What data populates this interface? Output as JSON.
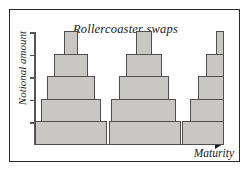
{
  "chart_data": {
    "type": "bar",
    "title": "Rollercoaster swaps",
    "xlabel": "Maturity",
    "ylabel": "Notional amount",
    "grid": false,
    "legend": null,
    "axis": {
      "y_tick_count": 5,
      "y_tick_values": [
        1,
        2,
        3,
        4,
        5
      ],
      "x_tick_labels": [],
      "ylim": [
        0,
        5.6
      ],
      "y_axis_arrow": false,
      "x_axis_arrow": true
    },
    "groups": [
      {
        "name": "period-1",
        "shape": "symmetric-pyramid",
        "steps": [
          {
            "level": 1,
            "value": 1,
            "x_start": 0.0,
            "x_end": 1.0
          },
          {
            "level": 2,
            "value": 2,
            "x_start": 0.08,
            "x_end": 0.92
          },
          {
            "level": 3,
            "value": 3,
            "x_start": 0.17,
            "x_end": 0.83
          },
          {
            "level": 4,
            "value": 4,
            "x_start": 0.26,
            "x_end": 0.74
          },
          {
            "level": 5,
            "value": 5,
            "x_start": 0.4,
            "x_end": 0.6
          }
        ]
      },
      {
        "name": "period-2",
        "shape": "symmetric-pyramid",
        "steps": [
          {
            "level": 1,
            "value": 1,
            "x_start": 0.0,
            "x_end": 1.0
          },
          {
            "level": 2,
            "value": 2,
            "x_start": 0.04,
            "x_end": 0.94
          },
          {
            "level": 3,
            "value": 3,
            "x_start": 0.14,
            "x_end": 0.84
          },
          {
            "level": 4,
            "value": 4,
            "x_start": 0.24,
            "x_end": 0.74
          },
          {
            "level": 5,
            "value": 5,
            "x_start": 0.38,
            "x_end": 0.6
          }
        ]
      },
      {
        "name": "period-3",
        "shape": "rising-staircase",
        "steps": [
          {
            "level": 1,
            "value": 1,
            "x_start": 0.0,
            "x_end": 1.0
          },
          {
            "level": 2,
            "value": 2,
            "x_start": 0.18,
            "x_end": 1.0
          },
          {
            "level": 3,
            "value": 3,
            "x_start": 0.38,
            "x_end": 1.0
          },
          {
            "level": 4,
            "value": 4,
            "x_start": 0.58,
            "x_end": 1.0
          },
          {
            "level": 5,
            "value": 5,
            "x_start": 0.8,
            "x_end": 1.0
          }
        ]
      }
    ],
    "colors": {
      "bar_fill": "#c8c7c3",
      "bar_stroke": "#4f4f4f",
      "axis": "#555555",
      "text": "#1a1a1a",
      "frame": "#2a2a2a",
      "background": "#ffffff"
    }
  }
}
